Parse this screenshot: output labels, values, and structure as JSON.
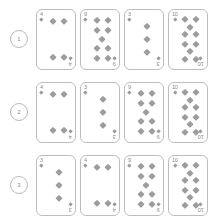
{
  "page": {
    "background_color": "#ffffff",
    "card_border_color": "#bdbdbd",
    "pip_color": "#9d9d9d",
    "text_color": "#8a8a8a",
    "rows_count": 3,
    "cards_per_row": 4
  },
  "pip_layouts": {
    "3": [
      [
        50,
        25
      ],
      [
        50,
        50
      ],
      [
        50,
        75
      ]
    ],
    "4": [
      [
        26,
        14
      ],
      [
        72,
        14
      ],
      [
        26,
        86
      ],
      [
        72,
        86
      ]
    ],
    "9": [
      [
        26,
        12
      ],
      [
        72,
        12
      ],
      [
        26,
        33
      ],
      [
        72,
        33
      ],
      [
        49,
        50
      ],
      [
        26,
        67
      ],
      [
        72,
        67
      ],
      [
        26,
        88
      ],
      [
        72,
        88
      ]
    ],
    "10": [
      [
        26,
        11
      ],
      [
        72,
        11
      ],
      [
        49,
        26
      ],
      [
        26,
        40
      ],
      [
        72,
        40
      ],
      [
        26,
        60
      ],
      [
        72,
        60
      ],
      [
        49,
        74
      ],
      [
        26,
        89
      ],
      [
        72,
        89
      ]
    ]
  },
  "rows": [
    {
      "badge": "1",
      "cards": [
        {
          "rank": "4",
          "pip_count": 4,
          "pip_key": "4"
        },
        {
          "rank": "9",
          "pip_count": 9,
          "pip_key": "9"
        },
        {
          "rank": "3",
          "pip_count": 3,
          "pip_key": "3"
        },
        {
          "rank": "10",
          "pip_count": 10,
          "pip_key": "10"
        }
      ]
    },
    {
      "badge": "2",
      "cards": [
        {
          "rank": "4",
          "pip_count": 4,
          "pip_key": "4"
        },
        {
          "rank": "3",
          "pip_count": 3,
          "pip_key": "3"
        },
        {
          "rank": "9",
          "pip_count": 9,
          "pip_key": "9"
        },
        {
          "rank": "10",
          "pip_count": 10,
          "pip_key": "10"
        }
      ]
    },
    {
      "badge": "3",
      "cards": [
        {
          "rank": "3",
          "pip_count": 3,
          "pip_key": "3"
        },
        {
          "rank": "4",
          "pip_count": 4,
          "pip_key": "4"
        },
        {
          "rank": "9",
          "pip_count": 9,
          "pip_key": "9"
        },
        {
          "rank": "10",
          "pip_count": 10,
          "pip_key": "10"
        }
      ]
    }
  ]
}
